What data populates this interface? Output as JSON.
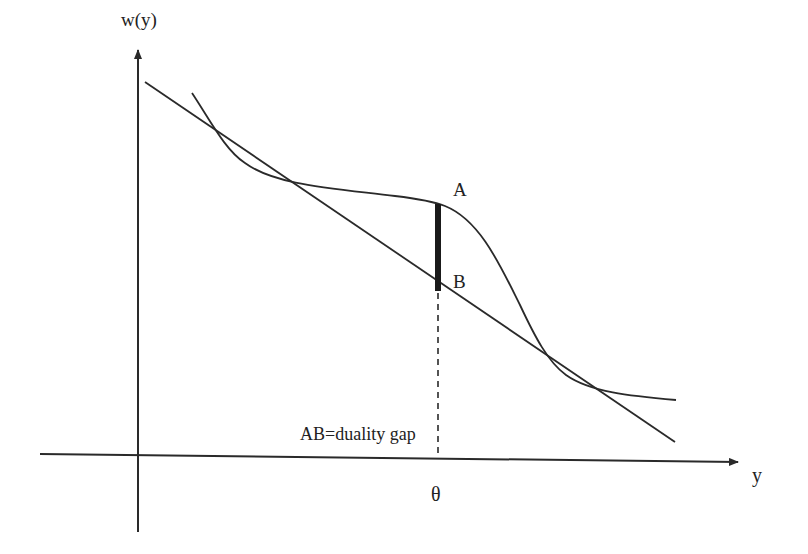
{
  "diagram": {
    "title": "",
    "colors": {
      "stroke": "#2a2a2a",
      "background": "#ffffff"
    },
    "axes": {
      "y_label": "w(y)",
      "x_label": "y"
    },
    "points": {
      "a_label": "A",
      "b_label": "B"
    },
    "tick": {
      "theta_label": "θ"
    },
    "annotation": {
      "gap_text": "AB=duality gap"
    },
    "elements": {
      "curve": "nonconvex dual function w(y)",
      "tangent_line": "supporting line touching curve at two points",
      "gap_segment": "thick vertical segment AB at θ",
      "dashed_guide": "dashed vertical line from B down to x-axis at θ"
    }
  }
}
